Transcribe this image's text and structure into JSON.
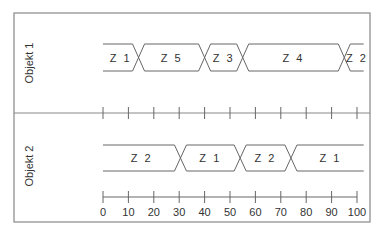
{
  "diagram": {
    "type": "timing-diagram",
    "axis": {
      "min": 0,
      "max": 100,
      "ticks": [
        0,
        10,
        20,
        30,
        40,
        50,
        60,
        70,
        80,
        90,
        100
      ],
      "tick_labels": [
        "0",
        "10",
        "20",
        "30",
        "40",
        "50",
        "60",
        "70",
        "80",
        "90",
        "100"
      ]
    },
    "objects": [
      {
        "label": "Objekt 1",
        "segments": [
          {
            "state": "Z 1",
            "start": 0,
            "end": 14
          },
          {
            "state": "Z 5",
            "start": 14,
            "end": 40
          },
          {
            "state": "Z 3",
            "start": 40,
            "end": 55
          },
          {
            "state": "Z 4",
            "start": 55,
            "end": 95
          },
          {
            "state": "Z 2",
            "start": 95,
            "end": 105
          }
        ]
      },
      {
        "label": "Objekt 2",
        "segments": [
          {
            "state": "Z 2",
            "start": 0,
            "end": 30.5
          },
          {
            "state": "Z 1",
            "start": 30.5,
            "end": 54
          },
          {
            "state": "Z 2",
            "start": 54,
            "end": 74
          },
          {
            "state": "Z 1",
            "start": 74,
            "end": 105
          }
        ]
      }
    ],
    "colors": {
      "line": "#666666",
      "frame": "#888888",
      "text": "#333333"
    }
  }
}
